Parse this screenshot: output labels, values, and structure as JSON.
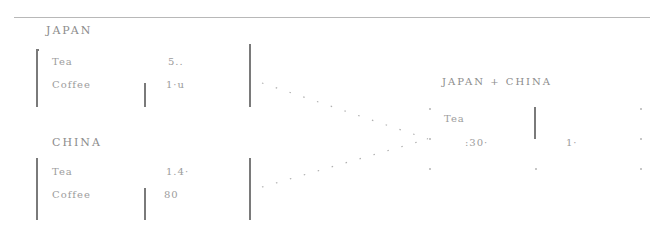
{
  "diagram": {
    "tables": [
      {
        "title": "JAPAN",
        "rows": [
          {
            "label": "Tea",
            "value": "5.."
          },
          {
            "label": "Coffee",
            "value": "1·u"
          }
        ]
      },
      {
        "title": "CHINA",
        "rows": [
          {
            "label": "Tea",
            "value": "1.4·"
          },
          {
            "label": "Coffee",
            "value": "80"
          }
        ]
      }
    ],
    "result": {
      "title": "JAPAN + CHINA",
      "row_label": "Tea",
      "values": [
        ":30·",
        "1·"
      ]
    },
    "connector_style": "dotted",
    "colors": {
      "ink": "#8c8c8c",
      "bracket": "#7a7a7a",
      "rule": "#b8b8b8"
    }
  }
}
